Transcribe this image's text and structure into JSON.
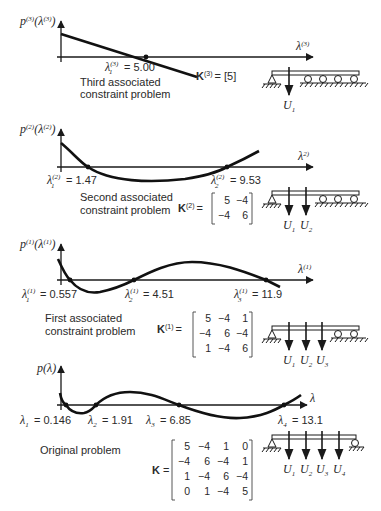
{
  "figure": {
    "panels": [
      {
        "id": "third",
        "y_axis_label": "p(3)(λ(3))",
        "x_axis_label": "λ(3)",
        "title_line1": "Third associated",
        "title_line2": "constraint problem",
        "roots": [
          {
            "name": "λ1(3)",
            "label_main": "λ",
            "label_sup": "(3)",
            "label_sub": "1",
            "value_text": "= 5.00",
            "value": 5.0
          }
        ],
        "stiffness_label": "K(3)",
        "stiffness_matrix": [
          [
            5
          ]
        ],
        "stiffness_text": "= [5]",
        "displacements": [
          "U1"
        ]
      },
      {
        "id": "second",
        "y_axis_label": "p(2)(λ(2))",
        "x_axis_label": "λ(2)",
        "title_line1": "Second associated",
        "title_line2": "constraint problem",
        "roots": [
          {
            "name": "λ1(2)",
            "label_main": "λ",
            "label_sup": "(2)",
            "label_sub": "1",
            "value_text": "= 1.47",
            "value": 1.47
          },
          {
            "name": "λ2(2)",
            "label_main": "λ",
            "label_sup": "(2)",
            "label_sub": "2",
            "value_text": "= 9.53",
            "value": 9.53
          }
        ],
        "stiffness_label": "K(2)",
        "stiffness_matrix": [
          [
            5,
            -4
          ],
          [
            -4,
            6
          ]
        ],
        "displacements": [
          "U1",
          "U2"
        ]
      },
      {
        "id": "first",
        "y_axis_label": "p(1)(λ(1))",
        "x_axis_label": "λ(1)",
        "title_line1": "First associated",
        "title_line2": "constraint problem",
        "roots": [
          {
            "name": "λ1(1)",
            "label_main": "λ",
            "label_sup": "(1)",
            "label_sub": "1",
            "value_text": "= 0.557",
            "value": 0.557
          },
          {
            "name": "λ2(1)",
            "label_main": "λ",
            "label_sup": "(1)",
            "label_sub": "2",
            "value_text": "= 4.51",
            "value": 4.51
          },
          {
            "name": "λ3(1)",
            "label_main": "λ",
            "label_sup": "(1)",
            "label_sub": "3",
            "value_text": "= 11.9",
            "value": 11.9
          }
        ],
        "stiffness_label": "K(1)",
        "stiffness_matrix": [
          [
            5,
            -4,
            1
          ],
          [
            -4,
            6,
            -4
          ],
          [
            1,
            -4,
            6
          ]
        ],
        "displacements": [
          "U1",
          "U2",
          "U3"
        ]
      },
      {
        "id": "original",
        "y_axis_label": "p(λ)",
        "x_axis_label": "λ",
        "title_line1": "Original problem",
        "roots": [
          {
            "name": "λ1",
            "label_main": "λ",
            "label_sub": "1",
            "value_text": "= 0.146",
            "value": 0.146
          },
          {
            "name": "λ2",
            "label_main": "λ",
            "label_sub": "2",
            "value_text": "= 1.91",
            "value": 1.91
          },
          {
            "name": "λ3",
            "label_main": "λ",
            "label_sub": "3",
            "value_text": "= 6.85",
            "value": 6.85
          },
          {
            "name": "λ4",
            "label_main": "λ",
            "label_sub": "4",
            "value_text": "= 13.1",
            "value": 13.1
          }
        ],
        "stiffness_label": "K",
        "stiffness_matrix": [
          [
            5,
            -4,
            1,
            0
          ],
          [
            -4,
            6,
            -4,
            1
          ],
          [
            1,
            -4,
            6,
            -4
          ],
          [
            0,
            1,
            -4,
            5
          ]
        ],
        "displacements": [
          "U1",
          "U2",
          "U3",
          "U4"
        ]
      }
    ],
    "text": {
      "p": "p",
      "lambda": "λ",
      "K": "K",
      "U": "U",
      "eq": "=",
      "sup3": "(3)",
      "sup2": "(2)",
      "sup1": "(1)",
      "br_open": "(",
      "br_close": ")"
    },
    "colors": {
      "ink": "#1a1a1a",
      "text": "#2a2a2a",
      "background": "#ffffff"
    }
  }
}
